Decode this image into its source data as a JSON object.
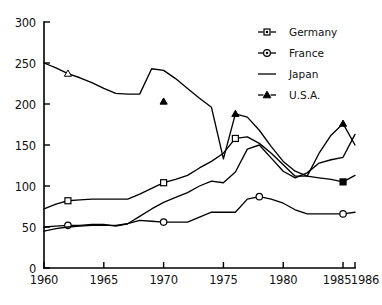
{
  "chart_data": {
    "type": "line",
    "title": "",
    "subtitle": "",
    "xlabel": "",
    "ylabel": "",
    "xlim": [
      1960,
      1986
    ],
    "ylim": [
      0,
      300
    ],
    "grid": false,
    "legend_position": "top-right",
    "xticks": [
      1960,
      1965,
      1970,
      1975,
      1980,
      1985,
      1986
    ],
    "xtick_labels": [
      "1960",
      "1965",
      "1970",
      "1975",
      "1980",
      "1985",
      "1986"
    ],
    "yticks": [
      0,
      50,
      100,
      150,
      200,
      250,
      300
    ],
    "ytick_labels": [
      "0",
      "50",
      "100",
      "150",
      "200",
      "250",
      "300"
    ],
    "series": [
      {
        "name": "Germany",
        "marker": "square",
        "legend_marker": "square-line",
        "x": [
          1960,
          1961,
          1962,
          1963,
          1964,
          1965,
          1966,
          1967,
          1968,
          1969,
          1970,
          1971,
          1972,
          1973,
          1974,
          1975,
          1976,
          1977,
          1978,
          1979,
          1980,
          1981,
          1982,
          1983,
          1984,
          1985,
          1986
        ],
        "values": [
          72,
          78,
          82,
          83,
          84,
          84,
          84,
          84,
          90,
          97,
          104,
          108,
          113,
          122,
          130,
          140,
          158,
          160,
          152,
          140,
          126,
          112,
          112,
          110,
          108,
          105,
          113
        ],
        "marker_points": [
          {
            "x": 1962,
            "y": 82
          },
          {
            "x": 1970,
            "y": 104
          },
          {
            "x": 1976,
            "y": 158
          },
          {
            "x": 1985,
            "y": 105
          }
        ]
      },
      {
        "name": "France",
        "marker": "circle",
        "legend_marker": "circle-line",
        "x": [
          1960,
          1961,
          1962,
          1963,
          1964,
          1965,
          1966,
          1967,
          1968,
          1969,
          1970,
          1971,
          1972,
          1973,
          1974,
          1975,
          1976,
          1977,
          1978,
          1979,
          1980,
          1981,
          1982,
          1983,
          1984,
          1985,
          1986
        ],
        "values": [
          50,
          51,
          52,
          52,
          53,
          53,
          51,
          54,
          58,
          57,
          56,
          56,
          56,
          62,
          68,
          68,
          68,
          84,
          87,
          84,
          79,
          71,
          66,
          66,
          66,
          66,
          68
        ],
        "marker_points": [
          {
            "x": 1962,
            "y": 52
          },
          {
            "x": 1970,
            "y": 56
          },
          {
            "x": 1978,
            "y": 87
          },
          {
            "x": 1985,
            "y": 66
          }
        ]
      },
      {
        "name": "Japan",
        "marker": "none",
        "legend_marker": "plain-line",
        "x": [
          1960,
          1961,
          1962,
          1963,
          1964,
          1965,
          1966,
          1967,
          1968,
          1969,
          1970,
          1971,
          1972,
          1973,
          1974,
          1975,
          1976,
          1977,
          1978,
          1979,
          1980,
          1981,
          1982,
          1983,
          1984,
          1985,
          1986
        ],
        "values": [
          45,
          48,
          50,
          51,
          52,
          52,
          52,
          54,
          63,
          72,
          80,
          86,
          92,
          100,
          106,
          104,
          117,
          145,
          150,
          134,
          118,
          110,
          116,
          128,
          132,
          135,
          163
        ],
        "marker_points": []
      },
      {
        "name": "U.S.A.",
        "marker": "triangle",
        "legend_marker": "triangle-line",
        "x": [
          1960,
          1961,
          1962,
          1963,
          1964,
          1965,
          1966,
          1967,
          1968,
          1969,
          1970,
          1971,
          1972,
          1973,
          1974,
          1975,
          1976,
          1977,
          1978,
          1979,
          1980,
          1981,
          1982,
          1983,
          1984,
          1985,
          1986
        ],
        "values": [
          250,
          244,
          237,
          232,
          226,
          219,
          213,
          212,
          212,
          243,
          241,
          231,
          219,
          207,
          196,
          133,
          188,
          184,
          168,
          148,
          130,
          118,
          112,
          140,
          162,
          176,
          150
        ],
        "marker_points": [
          {
            "x": 1962,
            "y": 237
          },
          {
            "x": 1970,
            "y": 203
          },
          {
            "x": 1976,
            "y": 188
          },
          {
            "x": 1985,
            "y": 176
          }
        ]
      }
    ]
  },
  "legend": {
    "entries": [
      {
        "label": "Germany",
        "icon": "square-marker-icon"
      },
      {
        "label": "France",
        "icon": "circle-marker-icon"
      },
      {
        "label": "Japan",
        "icon": "plain-line-icon"
      },
      {
        "label": "U.S.A.",
        "icon": "triangle-marker-icon"
      }
    ]
  },
  "colors": {
    "line": "#000000",
    "axis": "#000000",
    "background": "#ffffff",
    "marker_fill": "#ffffff"
  }
}
